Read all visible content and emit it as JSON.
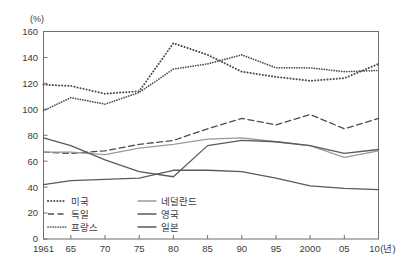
{
  "chart_data": {
    "type": "line",
    "title": "",
    "subtitle": "",
    "xlabel": "(년)",
    "ylabel": "(%)",
    "unit_label_y": "(%)",
    "unit_label_x": "(년)",
    "grid": false,
    "legend_position": "inside-bottom-left",
    "xlim": [
      1961,
      2010
    ],
    "ylim": [
      0,
      160
    ],
    "ytick_labels": [
      "0",
      "20",
      "40",
      "60",
      "80",
      "100",
      "120",
      "140",
      "160"
    ],
    "ytick_values": [
      0,
      20,
      40,
      60,
      80,
      100,
      120,
      140,
      160
    ],
    "xtick_labels": [
      "1961",
      "65",
      "70",
      "75",
      "80",
      "85",
      "90",
      "95",
      "2000",
      "05",
      "10"
    ],
    "xtick_values": [
      1961,
      1965,
      1970,
      1975,
      1980,
      1985,
      1990,
      1995,
      2000,
      2005,
      2010
    ],
    "x": [
      1961,
      1965,
      1970,
      1975,
      1980,
      1985,
      1990,
      1995,
      2000,
      2005,
      2010
    ],
    "series": [
      {
        "name": "미국",
        "style": "dotted",
        "color": "#4d4d4d",
        "values": [
          119,
          118,
          112,
          114,
          151,
          142,
          129,
          125,
          122,
          124,
          135
        ]
      },
      {
        "name": "독일",
        "style": "dashed",
        "color": "#4d4d4d",
        "values": [
          67,
          66,
          68,
          73,
          76,
          85,
          93,
          88,
          96,
          85,
          93
        ]
      },
      {
        "name": "프랑스",
        "style": "fine-dotted",
        "color": "#4d4d4d",
        "values": [
          99,
          109,
          104,
          113,
          131,
          135,
          142,
          132,
          132,
          129,
          130
        ]
      },
      {
        "name": "네덜란드",
        "style": "solid-light",
        "color": "#9a9a9a",
        "values": [
          67,
          67,
          65,
          70,
          73,
          77,
          78,
          75,
          72,
          63,
          68
        ]
      },
      {
        "name": "영국",
        "style": "solid",
        "color": "#5a5a5a",
        "values": [
          78,
          72,
          61,
          52,
          48,
          72,
          76,
          75,
          72,
          66,
          69
        ]
      },
      {
        "name": "일본",
        "style": "solid",
        "color": "#5a5a5a",
        "values": [
          42,
          45,
          46,
          47,
          53,
          53,
          52,
          47,
          41,
          39,
          38
        ]
      }
    ]
  },
  "legend": {
    "items": [
      {
        "label": "미국",
        "style": "dotted"
      },
      {
        "label": "독일",
        "style": "dashed"
      },
      {
        "label": "프랑스",
        "style": "fine-dotted"
      },
      {
        "label": "네덜란드",
        "style": "solid-light"
      },
      {
        "label": "영국",
        "style": "solid"
      },
      {
        "label": "일본",
        "style": "solid"
      }
    ]
  }
}
